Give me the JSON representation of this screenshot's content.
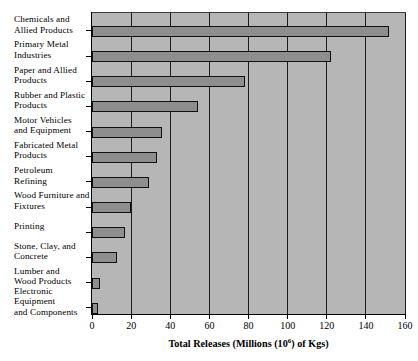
{
  "chart_data": {
    "type": "bar",
    "orientation": "horizontal",
    "title": "",
    "xlabel": "Total Releases (Millions (10^6) of Kgs)",
    "ylabel": "",
    "xlim": [
      0,
      160
    ],
    "xticks": [
      0,
      20,
      40,
      60,
      80,
      100,
      120,
      140,
      160
    ],
    "grid": "vertical",
    "legend": "none",
    "categories": [
      "Chemicals and\nAllied Products",
      "Primary Metal\nIndustries",
      "Paper and Allied\nProducts",
      "Rubber and Plastic\nProducts",
      "Motor Vehicles\nand Equipment",
      "Fabricated Metal\nProducts",
      "Petroleum\nRefining",
      "Wood Furniture and\nFixtures",
      "Printing",
      "Stone, Clay, and\nConcrete",
      "Lumber and\nWood Products",
      "Electronic\nEquipment\nand Components"
    ],
    "values": [
      152,
      122,
      78,
      54,
      36,
      33,
      29,
      20,
      17,
      13,
      4,
      3
    ]
  },
  "axis_title": {
    "prefix": "Total Releases (Millions (10",
    "superscript": "6",
    "suffix": ") of Kgs)"
  },
  "colors": {
    "plot_background": "#b6b6b6",
    "bar_fill": "#8e8e8e",
    "bar_outline": "#111111",
    "gridline": "#1c1c1c",
    "axis": "#000000",
    "text": "#000000",
    "page_background": "#ffffff"
  }
}
